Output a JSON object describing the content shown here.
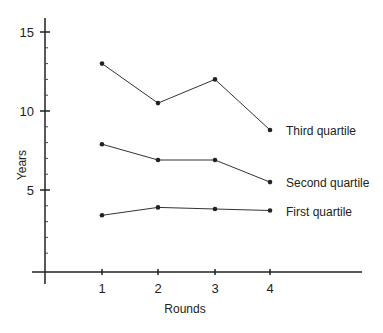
{
  "chart_data": {
    "type": "line",
    "title": "",
    "xlabel": "Rounds",
    "ylabel": "Years",
    "x": [
      1,
      2,
      3,
      4
    ],
    "x_tick_labels": [
      "1",
      "2",
      "3",
      "4"
    ],
    "y_tick_labels": [
      "5",
      "10",
      "15"
    ],
    "ylim": [
      0,
      16
    ],
    "grid": false,
    "legend_position": "inline-right",
    "series": [
      {
        "name": "Third quartile",
        "values": [
          13.0,
          10.5,
          12.0,
          8.8
        ]
      },
      {
        "name": "Second quartile",
        "values": [
          7.9,
          6.9,
          6.9,
          5.5
        ]
      },
      {
        "name": "First quartile",
        "values": [
          3.4,
          3.9,
          3.8,
          3.7
        ]
      }
    ]
  }
}
